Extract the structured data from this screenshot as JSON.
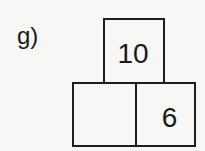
{
  "problem": {
    "label": "g)",
    "pyramid": {
      "top": {
        "value": "10"
      },
      "bottom": [
        {
          "value": ""
        },
        {
          "value": "6"
        }
      ]
    }
  }
}
